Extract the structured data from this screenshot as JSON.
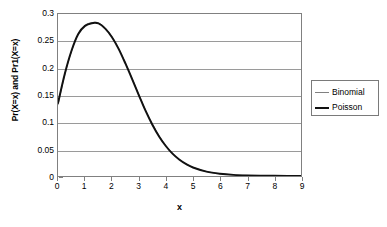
{
  "chart_data": {
    "type": "line",
    "title": "",
    "subtitle": "",
    "xlabel": "x",
    "ylabel": "Pr(X=x) and Pr1(X=x)",
    "xlim": [
      0,
      9
    ],
    "ylim": [
      0,
      0.3
    ],
    "grid": true,
    "grid_axis": "y",
    "legend_position": "right",
    "xticks": [
      "0",
      "1",
      "2",
      "3",
      "4",
      "5",
      "6",
      "7",
      "8",
      "9"
    ],
    "xtick_values": [
      0,
      1,
      2,
      3,
      4,
      5,
      6,
      7,
      8,
      9
    ],
    "yticks": [
      "0",
      "0.05",
      "0.1",
      "0.15",
      "0.2",
      "0.25",
      "0.3"
    ],
    "ytick_values": [
      0,
      0.05,
      0.1,
      0.15,
      0.2,
      0.25,
      0.3
    ],
    "x": [
      0,
      0.25,
      0.5,
      0.75,
      1,
      1.25,
      1.5,
      1.75,
      2,
      2.25,
      2.5,
      2.75,
      3,
      3.25,
      3.5,
      3.75,
      4,
      4.25,
      4.5,
      4.75,
      5,
      5.5,
      6,
      6.5,
      7,
      7.5,
      8,
      8.5,
      9
    ],
    "series": [
      {
        "name": "Binomial",
        "color": "#808080",
        "width": 1,
        "values": [
          0.132,
          0.187,
          0.231,
          0.263,
          0.279,
          0.284,
          0.2835,
          0.274,
          0.258,
          0.236,
          0.209,
          0.18,
          0.15,
          0.121,
          0.096,
          0.074,
          0.056,
          0.0415,
          0.0305,
          0.0222,
          0.016,
          0.0082,
          0.0042,
          0.0021,
          0.0011,
          0.00055,
          0.0003,
          0.00016,
          0.0001
        ]
      },
      {
        "name": "Poisson",
        "color": "#111111",
        "width": 2,
        "values": [
          0.135,
          0.189,
          0.232,
          0.263,
          0.278,
          0.283,
          0.2825,
          0.273,
          0.257,
          0.235,
          0.208,
          0.179,
          0.149,
          0.12,
          0.0945,
          0.0728,
          0.0551,
          0.0409,
          0.0301,
          0.0219,
          0.0158,
          0.0081,
          0.0042,
          0.0021,
          0.0011,
          0.00055,
          0.0003,
          0.00016,
          0.0001
        ]
      }
    ]
  },
  "legend": {
    "entries": [
      {
        "label": "Binomial"
      },
      {
        "label": "Poisson"
      }
    ]
  },
  "axis": {
    "x_title": "x",
    "y_title": "Pr(X=x) and Pr1(X=x)"
  },
  "colors": {
    "binomial": "#808080",
    "poisson": "#111111",
    "gridline": "#9a9a9a",
    "frame": "#808080",
    "background": "#ffffff",
    "text": "#000000"
  }
}
